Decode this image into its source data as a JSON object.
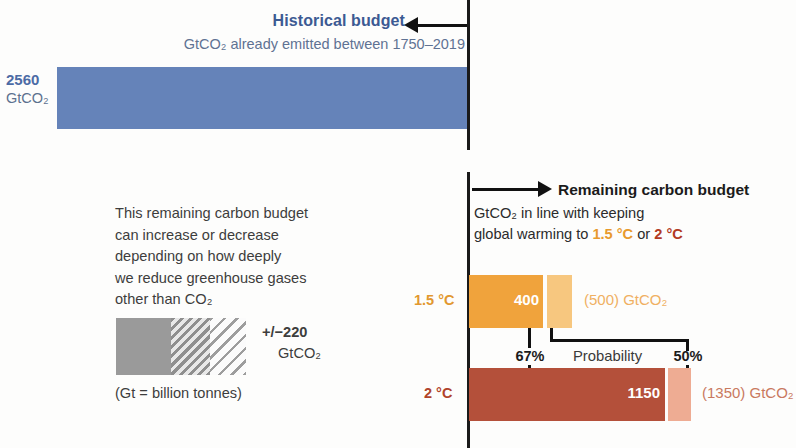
{
  "historical": {
    "title": "Historical budget",
    "subtitle": "GtCO₂ already emitted between 1750–2019",
    "value": "2560",
    "unit": "GtCO₂",
    "bar_color": "#6583b9",
    "title_color": "#3c5a93"
  },
  "explanation": {
    "lines": [
      "This remaining carbon budget",
      "can increase or decrease",
      "depending on how deeply",
      "we reduce greenhouse gases",
      "other than CO₂"
    ],
    "uncertainty_value": "+/−220",
    "uncertainty_unit": "GtCO₂",
    "footnote": "(Gt = billion tonnes)"
  },
  "remaining": {
    "title": "Remaining carbon budget",
    "subtitle_line1": "GtCO₂ in line with keeping",
    "subtitle_line2_pre": "global warming to ",
    "subtitle_line2_t15": "1.5 °C",
    "subtitle_line2_mid": " or ",
    "subtitle_line2_t20": "2 °C",
    "probability_label": "Probability",
    "probability_high": "67%",
    "probability_low": "50%",
    "scenarios": [
      {
        "label": "1.5 °C",
        "value_67": "400",
        "value_50": "(500) GtCO₂",
        "color_main": "#f0a33c",
        "color_ext": "#f7c77f",
        "label_color": "#e2982f"
      },
      {
        "label": "2 °C",
        "value_67": "1150",
        "value_50": "(1350) GtCO₂",
        "color_main": "#b4503a",
        "color_ext": "#eeac93",
        "label_color": "#b0432a"
      }
    ]
  },
  "chart_data": {
    "type": "bar",
    "orientation": "horizontal",
    "units": "GtCO2",
    "categories": [
      "Historical budget (1750–2019)",
      "Remaining 1.5 °C",
      "Remaining 2 °C"
    ],
    "series": [
      {
        "name": "Historical emitted",
        "values": [
          2560,
          null,
          null
        ]
      },
      {
        "name": "67% probability budget",
        "values": [
          null,
          400,
          1150
        ]
      },
      {
        "name": "50% probability budget",
        "values": [
          null,
          500,
          1350
        ]
      }
    ],
    "annotations": [
      "+/−220 GtCO2 uncertainty from non-CO2 greenhouse gas reductions",
      "Gt = billion tonnes"
    ],
    "legend": [
      "67%",
      "50%"
    ],
    "grid": false
  }
}
